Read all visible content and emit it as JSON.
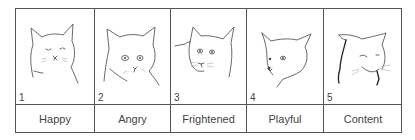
{
  "figure": {
    "panels": [
      {
        "number": "1",
        "label": "Happy",
        "icon": "cat-face-happy-icon"
      },
      {
        "number": "2",
        "label": "Angry",
        "icon": "cat-face-angry-icon"
      },
      {
        "number": "3",
        "label": "Frightened",
        "icon": "cat-face-frightened-icon"
      },
      {
        "number": "4",
        "label": "Playful",
        "icon": "cat-face-playful-icon"
      },
      {
        "number": "5",
        "label": "Content",
        "icon": "cat-face-content-icon"
      }
    ],
    "colors": {
      "line": "#444444",
      "border": "#555555",
      "background": "#ffffff"
    }
  }
}
